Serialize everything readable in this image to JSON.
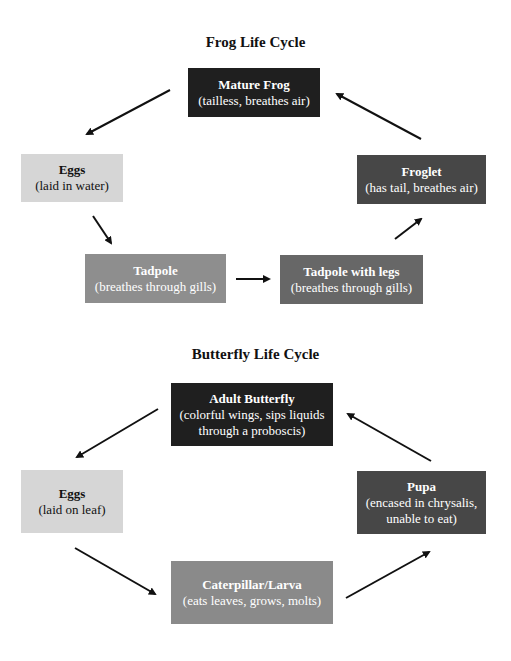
{
  "frog": {
    "title": "Frog Life Cycle",
    "stages": [
      {
        "name": "Mature Frog",
        "desc": "(tailless, breathes air)",
        "color": "#1f1f1f"
      },
      {
        "name": "Eggs",
        "desc": "(laid in water)",
        "color": "#d6d6d6"
      },
      {
        "name": "Tadpole",
        "desc": "(breathes through gills)",
        "color": "#8e8e8e"
      },
      {
        "name": "Tadpole with legs",
        "desc": "(breathes through gills)",
        "color": "#676767"
      },
      {
        "name": "Froglet",
        "desc": "(has tail, breathes air)",
        "color": "#474747"
      }
    ]
  },
  "butterfly": {
    "title": "Butterfly Life Cycle",
    "stages": [
      {
        "name": "Adult Butterfly",
        "desc": "(colorful wings, sips liquids through a proboscis)",
        "color": "#1f1f1f"
      },
      {
        "name": "Eggs",
        "desc": "(laid on leaf)",
        "color": "#d6d6d6"
      },
      {
        "name": "Caterpillar/Larva",
        "desc": "(eats leaves, grows, molts)",
        "color": "#8a8a8a"
      },
      {
        "name": "Pupa",
        "desc": "(encased in chrysalis, unable to eat)",
        "color": "#474747"
      }
    ]
  }
}
